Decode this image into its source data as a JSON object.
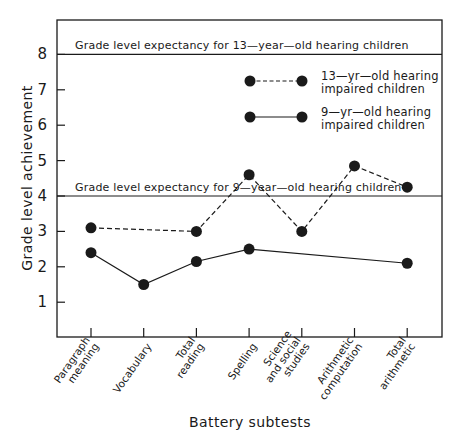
{
  "chart_data": {
    "type": "line",
    "title": "",
    "xlabel": "Battery subtests",
    "ylabel": "Grade level achievement",
    "ylim": [
      0,
      8.8
    ],
    "yticks": [
      1,
      2,
      3,
      4,
      5,
      6,
      7,
      8
    ],
    "grid": false,
    "legend_position": "upper right (inside plot)",
    "categories": [
      [
        "Paragraph",
        "meaning"
      ],
      [
        "Vocabulary"
      ],
      [
        "Total",
        "reading"
      ],
      [
        "Spelling"
      ],
      [
        "Science",
        "and social",
        "studies"
      ],
      [
        "Arithmetic",
        "computation"
      ],
      [
        "Total",
        "arithmetic"
      ]
    ],
    "series": [
      {
        "name": "13-yr-old hearing impaired children",
        "legend_lines": [
          "13—yr—old hearing",
          "impaired children"
        ],
        "style": "dashed",
        "values": [
          3.1,
          null,
          3.0,
          4.6,
          3.0,
          4.85,
          4.25
        ]
      },
      {
        "name": "9-yr-old hearing impaired children",
        "legend_lines": [
          "9—yr—old hearing",
          "impaired children"
        ],
        "style": "solid",
        "values": [
          2.4,
          1.5,
          2.15,
          2.5,
          null,
          null,
          2.1
        ]
      }
    ],
    "reference_lines": [
      {
        "y": 8,
        "label": "Grade level expectancy for 13—year—old hearing children"
      },
      {
        "y": 4,
        "label": "Grade level expectancy for 9—year—old hearing children"
      }
    ],
    "colors": {
      "ink": "#1a1a1a",
      "background": "#ffffff"
    }
  }
}
